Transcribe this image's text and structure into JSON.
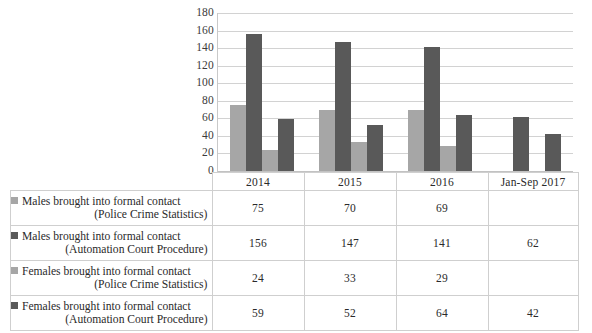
{
  "chart_data": {
    "type": "bar",
    "title": "",
    "xlabel": "",
    "ylabel": "",
    "grid": true,
    "legend_position": "table-below",
    "ylim": [
      0,
      180
    ],
    "yticks": [
      180,
      160,
      140,
      120,
      100,
      80,
      60,
      40,
      20,
      0
    ],
    "categories": [
      "2014",
      "2015",
      "2016",
      "Jan-Sep 2017"
    ],
    "series": [
      {
        "name": "Males brought into formal contact (Police Crime Statistics)",
        "name_line1": "Males brought into formal contact",
        "name_line2": "(Police Crime Statistics)",
        "color": "#a6a6a6",
        "values": [
          75,
          70,
          69,
          null
        ],
        "display_values": [
          "75",
          "70",
          "69",
          ""
        ]
      },
      {
        "name": "Males brought into formal contact (Automation Court Procedure)",
        "name_line1": "Males brought into formal contact",
        "name_line2": "(Automation Court Procedure)",
        "color": "#595959",
        "values": [
          156,
          147,
          141,
          62
        ],
        "display_values": [
          "156",
          "147",
          "141",
          "62"
        ]
      },
      {
        "name": "Females brought into formal contact (Police Crime Statistics)",
        "name_line1": "Females brought into formal contact",
        "name_line2": "(Police Crime Statistics)",
        "color": "#a6a6a6",
        "values": [
          24,
          33,
          29,
          null
        ],
        "display_values": [
          "24",
          "33",
          "29",
          ""
        ]
      },
      {
        "name": "Females brought into formal contact (Automation Court Procedure)",
        "name_line1": "Females brought into formal contact",
        "name_line2": "(Automation Court Procedure)",
        "color": "#595959",
        "values": [
          59,
          52,
          64,
          42
        ],
        "display_values": [
          "59",
          "52",
          "64",
          "42"
        ]
      }
    ]
  },
  "table": {
    "corner_label": "",
    "column_headers": [
      "2014",
      "2015",
      "2016",
      "Jan-Sep 2017"
    ],
    "rows": [
      {
        "swatch_color": "#a6a6a6",
        "label_line1": "Males brought into formal contact",
        "label_line2": "(Police Crime Statistics)",
        "values": [
          "75",
          "70",
          "69",
          ""
        ]
      },
      {
        "swatch_color": "#595959",
        "label_line1": "Males brought into formal contact",
        "label_line2": "(Automation Court Procedure)",
        "values": [
          "156",
          "147",
          "141",
          "62"
        ]
      },
      {
        "swatch_color": "#a6a6a6",
        "label_line1": "Females brought into formal contact",
        "label_line2": "(Police Crime Statistics)",
        "values": [
          "24",
          "33",
          "29",
          ""
        ]
      },
      {
        "swatch_color": "#595959",
        "label_line1": "Females brought into formal contact",
        "label_line2": "(Automation Court Procedure)",
        "values": [
          "59",
          "52",
          "64",
          "42"
        ]
      }
    ]
  },
  "colors": {
    "light_series": "#a6a6a6",
    "dark_series": "#595959",
    "gridline": "#d2d2d2",
    "border": "#cfcfcf",
    "text": "#2a2a2a",
    "background": "#ffffff"
  }
}
